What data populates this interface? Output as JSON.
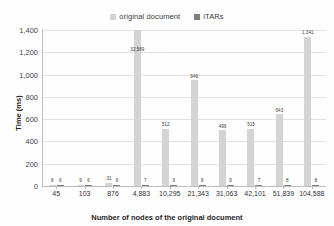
{
  "chart_data": {
    "type": "bar",
    "title": "",
    "xlabel": "Number of nodes of the original document",
    "ylabel": "Time (ms)",
    "ylim": [
      0,
      1400
    ],
    "ytick_step": 200,
    "grid": true,
    "legend_position": "top-center",
    "categories": [
      "45",
      "103",
      "876",
      "4,883",
      "10,295",
      "21,343",
      "31,063",
      "42,101",
      "51,839",
      "104,588"
    ],
    "series": [
      {
        "name": "original document",
        "color": "#d4d4d4",
        "values": [
          8,
          9,
          31,
          32569,
          512,
          949,
          499,
          515,
          643,
          1341
        ],
        "labels": [
          "8",
          "9",
          "31",
          "32,569",
          "512",
          "949",
          "499",
          "515",
          "643",
          "1,341"
        ]
      },
      {
        "name": "iTARs",
        "color": "#7f7f7f",
        "values": [
          6,
          6,
          6,
          7,
          9,
          8,
          9,
          7,
          8,
          8
        ],
        "labels": [
          "6",
          "6",
          "6",
          "7",
          "9",
          "8",
          "9",
          "7",
          "8",
          "8"
        ]
      }
    ],
    "ytick_labels": [
      "0",
      "200",
      "400",
      "600",
      "800",
      "1,000",
      "1,200",
      "1,400"
    ]
  },
  "legend": {
    "entries": [
      {
        "label": "original document",
        "color": "#d4d4d4"
      },
      {
        "label": "iTARs",
        "color": "#7f7f7f"
      }
    ]
  },
  "axes": {
    "y_title": "Time (ms)",
    "x_title": "Number of nodes of the original document"
  }
}
